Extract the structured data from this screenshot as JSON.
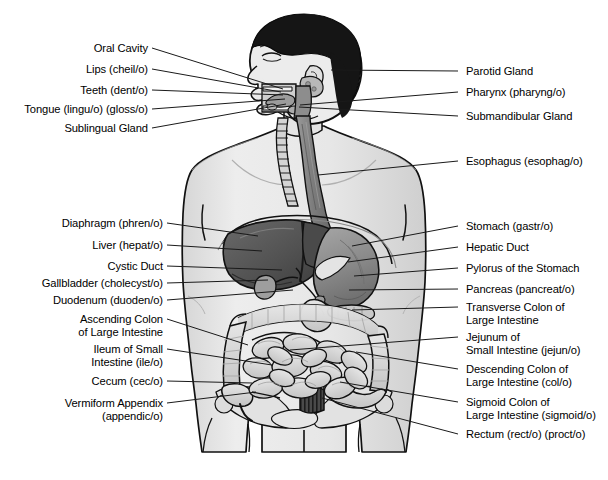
{
  "figure": {
    "view": "anterior torso with head in left profile",
    "colors": {
      "background": "#ffffff",
      "skin": "#e9e9e9",
      "skin_shade": "#d2d2d2",
      "outline": "#111111",
      "hair": "#151515",
      "liver": "#5d5d5d",
      "liver_dark": "#3f3f3f",
      "stomach": "#8f8f8f",
      "stomach_light": "#e2e2e2",
      "intestine": "#dcdcdc",
      "intestine_shade": "#b9b9b9",
      "esophagus": "#8b8b8b",
      "trachea": "#cfcfcf",
      "rectum": "#3a3a3a",
      "leader": "#1a1a1a"
    }
  },
  "labels_left": [
    {
      "id": "oral-cavity",
      "lines": [
        "Oral Cavity"
      ],
      "x": 85,
      "y": 42,
      "lx": 152,
      "ly": 48,
      "tx": 283,
      "ty": 89
    },
    {
      "id": "lips",
      "lines": [
        "Lips (cheil/o)"
      ],
      "x": 71,
      "y": 63,
      "lx": 152,
      "ly": 69,
      "tx": 281,
      "ty": 92
    },
    {
      "id": "teeth",
      "lines": [
        "Teeth (dent/o)"
      ],
      "x": 68,
      "y": 84,
      "lx": 152,
      "ly": 90,
      "tx": 283,
      "ty": 95
    },
    {
      "id": "tongue",
      "lines": [
        "Tongue (lingu/o) (gloss/o)"
      ],
      "x": 13,
      "y": 103,
      "lx": 152,
      "ly": 109,
      "tx": 285,
      "ty": 99
    },
    {
      "id": "sublingual-gland",
      "lines": [
        "Sublingual Gland"
      ],
      "x": 53,
      "y": 122,
      "lx": 152,
      "ly": 128,
      "tx": 286,
      "ty": 104
    },
    {
      "id": "diaphragm",
      "lines": [
        "Diaphragm (phren/o)"
      ],
      "x": 36,
      "y": 217,
      "lx": 167,
      "ly": 223,
      "tx": 258,
      "ty": 236
    },
    {
      "id": "liver",
      "lines": [
        "Liver (hepat/o)"
      ],
      "x": 61,
      "y": 239,
      "lx": 167,
      "ly": 245,
      "tx": 262,
      "ty": 251
    },
    {
      "id": "cystic-duct",
      "lines": [
        "Cystic Duct"
      ],
      "x": 71,
      "y": 260,
      "lx": 167,
      "ly": 266,
      "tx": 282,
      "ty": 270
    },
    {
      "id": "gallbladder",
      "lines": [
        "Gallbladder (cholecyst/o)"
      ],
      "x": 12,
      "y": 277,
      "lx": 167,
      "ly": 283,
      "tx": 268,
      "ty": 280
    },
    {
      "id": "duodenum",
      "lines": [
        "Duodenum (duoden/o)"
      ],
      "x": 31,
      "y": 294,
      "lx": 167,
      "ly": 300,
      "tx": 293,
      "ty": 290
    },
    {
      "id": "ascending-colon",
      "lines": [
        "Ascending Colon",
        "of Large Intestine"
      ],
      "x": 33,
      "y": 313,
      "lx": 167,
      "ly": 319,
      "tx": 248,
      "ty": 345
    },
    {
      "id": "ileum",
      "lines": [
        "Ileum of Small",
        "Intestine (ile/o)"
      ],
      "x": 52,
      "y": 343,
      "lx": 167,
      "ly": 349,
      "tx": 272,
      "ty": 365
    },
    {
      "id": "cecum",
      "lines": [
        "Cecum (cec/o)"
      ],
      "x": 68,
      "y": 375,
      "lx": 167,
      "ly": 381,
      "tx": 252,
      "ty": 383
    },
    {
      "id": "vermiform-appendix",
      "lines": [
        "Vermiform Appendix",
        "(appendic/o)"
      ],
      "x": 17,
      "y": 397,
      "lx": 167,
      "ly": 403,
      "tx": 256,
      "ty": 392
    }
  ],
  "labels_right": [
    {
      "id": "parotid-gland",
      "lines": [
        "Parotid Gland"
      ],
      "x": 466,
      "y": 65,
      "lx": 458,
      "ly": 71,
      "tx": 331,
      "ty": 70
    },
    {
      "id": "pharynx",
      "lines": [
        "Pharynx (pharyng/o)"
      ],
      "x": 466,
      "y": 86,
      "lx": 458,
      "ly": 92,
      "tx": 300,
      "ty": 105
    },
    {
      "id": "submandibular-gland",
      "lines": [
        "Submandibular Gland"
      ],
      "x": 466,
      "y": 110,
      "lx": 458,
      "ly": 116,
      "tx": 299,
      "ty": 107
    },
    {
      "id": "esophagus",
      "lines": [
        "Esophagus (esophag/o)"
      ],
      "x": 466,
      "y": 155,
      "lx": 458,
      "ly": 161,
      "tx": 318,
      "ty": 175
    },
    {
      "id": "stomach",
      "lines": [
        "Stomach (gastr/o)"
      ],
      "x": 466,
      "y": 220,
      "lx": 458,
      "ly": 226,
      "tx": 352,
      "ty": 246
    },
    {
      "id": "hepatic-duct",
      "lines": [
        "Hepatic Duct"
      ],
      "x": 466,
      "y": 241,
      "lx": 458,
      "ly": 247,
      "tx": 348,
      "ty": 262
    },
    {
      "id": "pylorus",
      "lines": [
        "Pylorus of the Stomach"
      ],
      "x": 466,
      "y": 262,
      "lx": 458,
      "ly": 268,
      "tx": 354,
      "ty": 276
    },
    {
      "id": "pancreas",
      "lines": [
        "Pancreas (pancreat/o)"
      ],
      "x": 466,
      "y": 283,
      "lx": 458,
      "ly": 289,
      "tx": 349,
      "ty": 290
    },
    {
      "id": "transverse-colon",
      "lines": [
        "Transverse Colon of",
        "Large Intestine"
      ],
      "x": 466,
      "y": 301,
      "lx": 458,
      "ly": 307,
      "tx": 352,
      "ty": 310
    },
    {
      "id": "jejunum",
      "lines": [
        "Jejunum of",
        "Small Intestine (jejun/o)"
      ],
      "x": 466,
      "y": 331,
      "lx": 458,
      "ly": 337,
      "tx": 290,
      "ty": 350
    },
    {
      "id": "descending-colon",
      "lines": [
        "Descending Colon of",
        "Large Intestine (col/o)"
      ],
      "x": 466,
      "y": 363,
      "lx": 458,
      "ly": 369,
      "tx": 356,
      "ty": 352
    },
    {
      "id": "sigmoid-colon",
      "lines": [
        "Sigmoid Colon of",
        "Large Intestine (sigmoid/o)"
      ],
      "x": 466,
      "y": 396,
      "lx": 458,
      "ly": 402,
      "tx": 340,
      "ty": 382
    },
    {
      "id": "rectum",
      "lines": [
        "Rectum (rect/o) (proct/o)"
      ],
      "x": 466,
      "y": 428,
      "lx": 458,
      "ly": 434,
      "tx": 322,
      "ty": 398
    }
  ]
}
